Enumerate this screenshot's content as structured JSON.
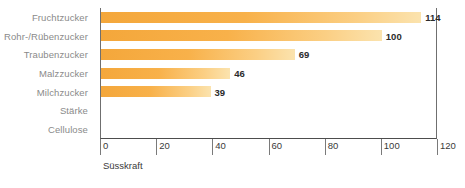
{
  "chart_data": {
    "type": "bar",
    "orientation": "horizontal",
    "title": "",
    "subtitle": "",
    "xlabel": "Süsskraft",
    "ylabel": "",
    "categories": [
      "Fruchtzucker",
      "Rohr-/Rübenzucker",
      "Traubenzucker",
      "Malzzucker",
      "Milchzucker",
      "Stärke",
      "Cellulose"
    ],
    "values": [
      114,
      100,
      69,
      46,
      39,
      0,
      0
    ],
    "value_labels": [
      "114",
      "100",
      "69",
      "46",
      "39",
      "",
      ""
    ],
    "xlim": [
      0,
      120
    ],
    "xticks": [
      0,
      20,
      40,
      60,
      80,
      100,
      120
    ],
    "xtick_labels": [
      "0",
      "20",
      "40",
      "60",
      "80",
      "100",
      "120"
    ],
    "grid": false,
    "legend": false,
    "colors": {
      "bar_start": "#f4a73b",
      "bar_end": "#fbe3ae",
      "category_label": "#8a8a8a",
      "value_label": "#2b2b2b",
      "axis_line": "#4d4d4d",
      "tick_text": "#3a3a3a",
      "background": "#ffffff"
    }
  }
}
